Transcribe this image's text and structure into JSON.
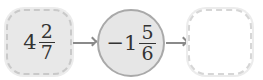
{
  "flow": {
    "input": {
      "whole": "4",
      "numerator": "2",
      "denominator": "7"
    },
    "operator": {
      "whole": "−1",
      "numerator": "5",
      "denominator": "6"
    },
    "output": {
      "value": ""
    }
  },
  "colors": {
    "box_fill": "#e8e8e8",
    "circle_fill": "#e6e6e6",
    "circle_border": "#a9a9a9",
    "arrow": "#8a8a8a"
  }
}
